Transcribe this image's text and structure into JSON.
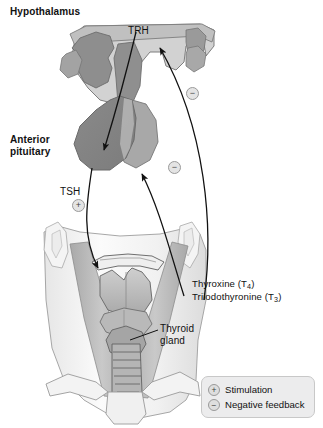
{
  "diagram": {
    "labels": {
      "hypothalamus": "Hypothalamus",
      "trh": "TRH",
      "anterior_pituitary_line1": "Anterior",
      "anterior_pituitary_line2": "pituitary",
      "tsh": "TSH",
      "thyroxine": "Thyroxine (T",
      "thyroxine_sub": "4",
      "thyroxine_end": ")",
      "triiodothyronine": "Triiodothyronine (T",
      "triiodothyronine_sub": "3",
      "triiodothyronine_end": ")",
      "thyroid_gland_line1": "Thyroid",
      "thyroid_gland_line2": "gland"
    },
    "badges": {
      "tsh_stimulation": "+",
      "negative_upper": "−",
      "negative_lower": "−"
    },
    "legend": {
      "items": [
        {
          "symbol": "+",
          "label": "Stimulation"
        },
        {
          "symbol": "−",
          "label": "Negative feedback"
        }
      ]
    },
    "colors": {
      "background": "#ffffff",
      "brain_light": "#cfcfcf",
      "brain_mid": "#b4b4b4",
      "brain_dark": "#8e8e8e",
      "pituitary_dark": "#8a8a8a",
      "pituitary_mid": "#a6a6a6",
      "neck_light": "#f2f2f2",
      "muscle_gray": "#bdbdbd",
      "outline": "#6d6d6d",
      "arrow": "#111111",
      "legend_fill": "#ececed",
      "legend_border": "#c8c8c8"
    }
  }
}
